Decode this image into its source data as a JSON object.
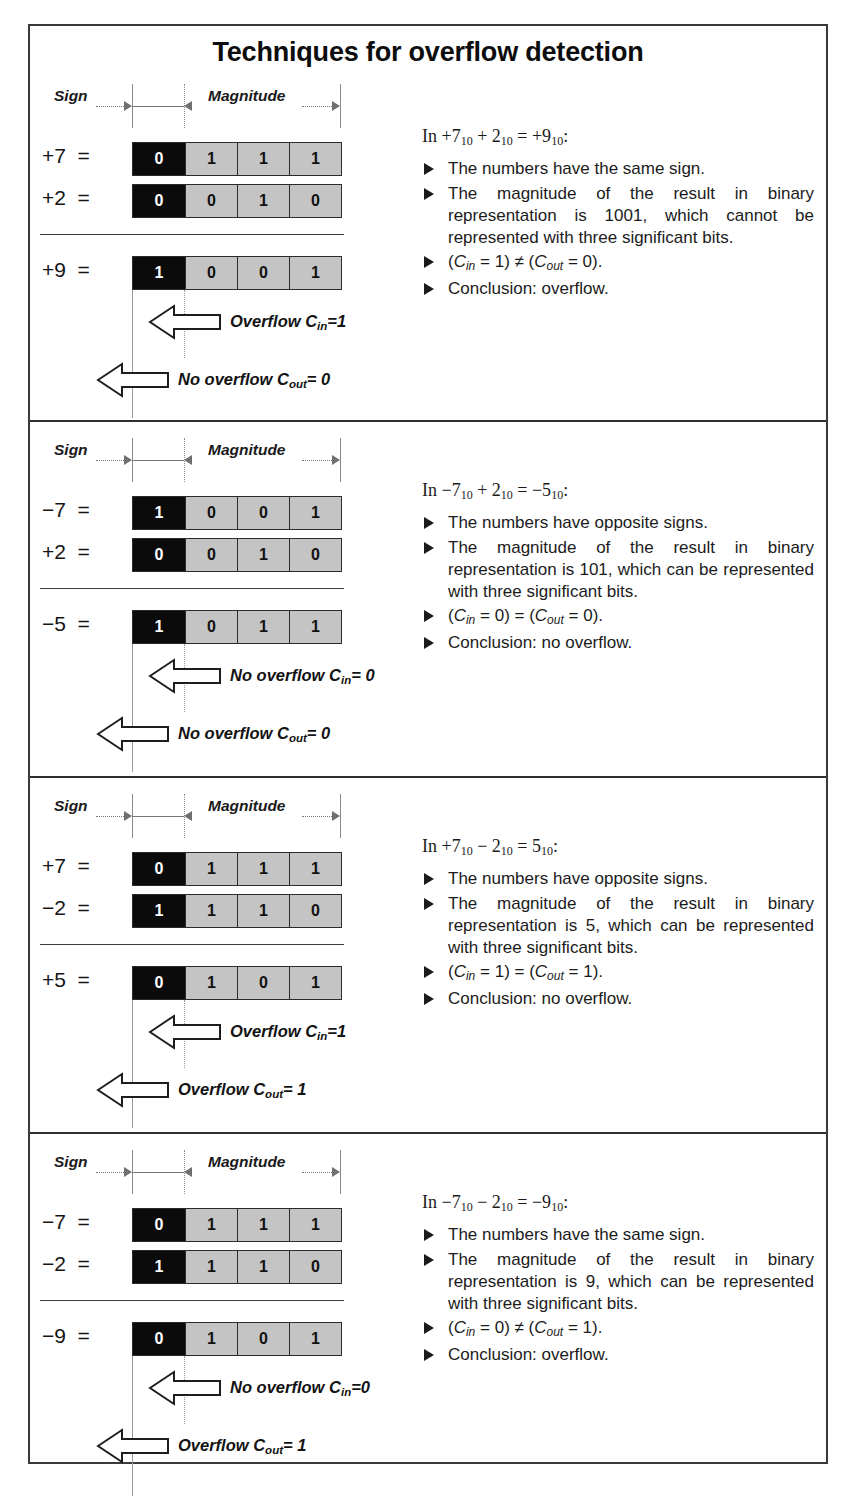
{
  "title": "Techniques for overflow detection",
  "ruler": {
    "sign_label": "Sign",
    "magnitude_label": "Magnitude"
  },
  "blocks": [
    {
      "id": "b1",
      "rows": [
        {
          "label": "+7  =",
          "bits": [
            "0",
            "1",
            "1",
            "1"
          ]
        },
        {
          "label": "+2  =",
          "bits": [
            "0",
            "0",
            "1",
            "0"
          ]
        }
      ],
      "result": {
        "label": "+9  =",
        "bits": [
          "1",
          "0",
          "0",
          "1"
        ]
      },
      "cin_text": "Overflow C",
      "cin_sub": "in",
      "cin_value": "=1",
      "cout_text": "No overflow C",
      "cout_sub": "out",
      "cout_value": "= 0",
      "head": "In +7₁₀ + 2₁₀ = +9₁₀:",
      "head_prefix": "In",
      "head_terms": [
        {
          "num": "+7",
          "sub": "10"
        },
        {
          "op": "+"
        },
        {
          "num": "2",
          "sub": "10"
        },
        {
          "op": "="
        },
        {
          "num": "+9",
          "sub": "10"
        }
      ],
      "bullets": [
        "The numbers have the same sign.",
        "The magnitude of the result in binary representation is 1001, which cannot be represented with three significant bits."
      ],
      "carry_relation": {
        "cin": "0",
        "left_val": "1",
        "op": "≠",
        "right_val": "0"
      },
      "conclusion": "Conclusion: overflow."
    },
    {
      "id": "b2",
      "rows": [
        {
          "label": "−7  =",
          "bits": [
            "1",
            "0",
            "0",
            "1"
          ]
        },
        {
          "label": "+2  =",
          "bits": [
            "0",
            "0",
            "1",
            "0"
          ]
        }
      ],
      "result": {
        "label": "−5  =",
        "bits": [
          "1",
          "0",
          "1",
          "1"
        ]
      },
      "cin_text": "No overflow C",
      "cin_sub": "in",
      "cin_value": "= 0",
      "cout_text": "No overflow C",
      "cout_sub": "out",
      "cout_value": "= 0",
      "head_prefix": "In",
      "head_terms": [
        {
          "num": "−7",
          "sub": "10"
        },
        {
          "op": "+"
        },
        {
          "num": "2",
          "sub": "10"
        },
        {
          "op": "="
        },
        {
          "num": "−5",
          "sub": "10"
        }
      ],
      "bullets": [
        "The numbers have opposite signs.",
        "The magnitude of the result in binary representation is 101, which can be represented with three significant bits."
      ],
      "carry_relation": {
        "left_val": "0",
        "op": "=",
        "right_val": "0"
      },
      "conclusion": "Conclusion: no overflow."
    },
    {
      "id": "b3",
      "rows": [
        {
          "label": "+7  =",
          "bits": [
            "0",
            "1",
            "1",
            "1"
          ]
        },
        {
          "label": "−2  =",
          "bits": [
            "1",
            "1",
            "1",
            "0"
          ]
        }
      ],
      "result": {
        "label": "+5  =",
        "bits": [
          "0",
          "1",
          "0",
          "1"
        ]
      },
      "cin_text": "Overflow C",
      "cin_sub": "in",
      "cin_value": "=1",
      "cout_text": "Overflow C",
      "cout_sub": "out",
      "cout_value": "= 1",
      "head_prefix": "In",
      "head_terms": [
        {
          "num": "+7",
          "sub": "10"
        },
        {
          "op": "−"
        },
        {
          "num": "2",
          "sub": "10"
        },
        {
          "op": "="
        },
        {
          "num": "5",
          "sub": "10"
        }
      ],
      "bullets": [
        "The numbers have opposite signs.",
        "The magnitude of the result in binary representation is 5, which can be represented with three significant bits."
      ],
      "carry_relation": {
        "left_val": "1",
        "op": "=",
        "right_val": "1"
      },
      "conclusion": "Conclusion: no overflow."
    },
    {
      "id": "b4",
      "rows": [
        {
          "label": "−7  =",
          "bits": [
            "0",
            "1",
            "1",
            "1"
          ]
        },
        {
          "label": "−2  =",
          "bits": [
            "1",
            "1",
            "1",
            "0"
          ]
        }
      ],
      "result": {
        "label": "−9  =",
        "bits": [
          "0",
          "1",
          "0",
          "1"
        ]
      },
      "cin_text": "No overflow C",
      "cin_sub": "in",
      "cin_value": "=0",
      "cout_text": "Overflow C",
      "cout_sub": "out",
      "cout_value": "= 1",
      "head_prefix": "In",
      "head_terms": [
        {
          "num": "−7",
          "sub": "10"
        },
        {
          "op": "−"
        },
        {
          "num": "2",
          "sub": "10"
        },
        {
          "op": "="
        },
        {
          "num": "−9",
          "sub": "10"
        }
      ],
      "bullets": [
        "The numbers have the same sign.",
        "The magnitude of the result in binary representation is 9, which can be represented with three significant bits."
      ],
      "carry_relation": {
        "left_val": "0",
        "op": "≠",
        "right_val": "1"
      },
      "conclusion": "Conclusion: overflow."
    }
  ],
  "symbols": {
    "c_symbol": "C",
    "cin_sub": "in",
    "cout_sub": "out",
    "paren_open": "(",
    "paren_close": ")",
    "equals": "=",
    "period": "."
  },
  "colors": {
    "sign_cell": "#0b0b0b",
    "magnitude_cell": "#c4c4c4",
    "frame": "#3a3a3a",
    "text": "#1b1b1b"
  }
}
